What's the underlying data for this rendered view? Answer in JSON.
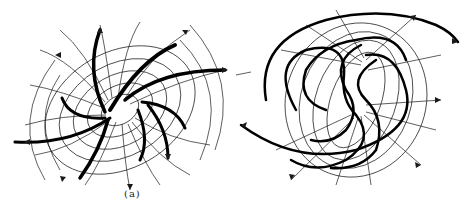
{
  "figures": [
    {
      "id": "a",
      "caption": "(a)",
      "description": "Field/stream pattern with six curved blades radiating from two central singular points, crossed by orthogonal curve families with arrows"
    },
    {
      "id": "b",
      "caption": "(b)",
      "description": "Field/stream pattern with interleaved S-shaped spiral curves around two centers, crossed by orthogonal curve families with arrows and tick marks"
    }
  ],
  "colors": {
    "line": "#1a1a1a",
    "background": "#ffffff"
  }
}
